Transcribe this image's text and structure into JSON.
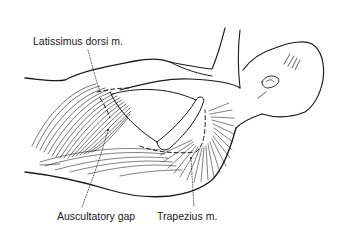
{
  "figure": {
    "labels": {
      "latissimus": "Latissimus dorsi m.",
      "auscultatory": "Auscultatory gap",
      "trapezius": "Trapezius m."
    },
    "colors": {
      "ink": "#1a1a1a",
      "background": "#ffffff"
    }
  }
}
